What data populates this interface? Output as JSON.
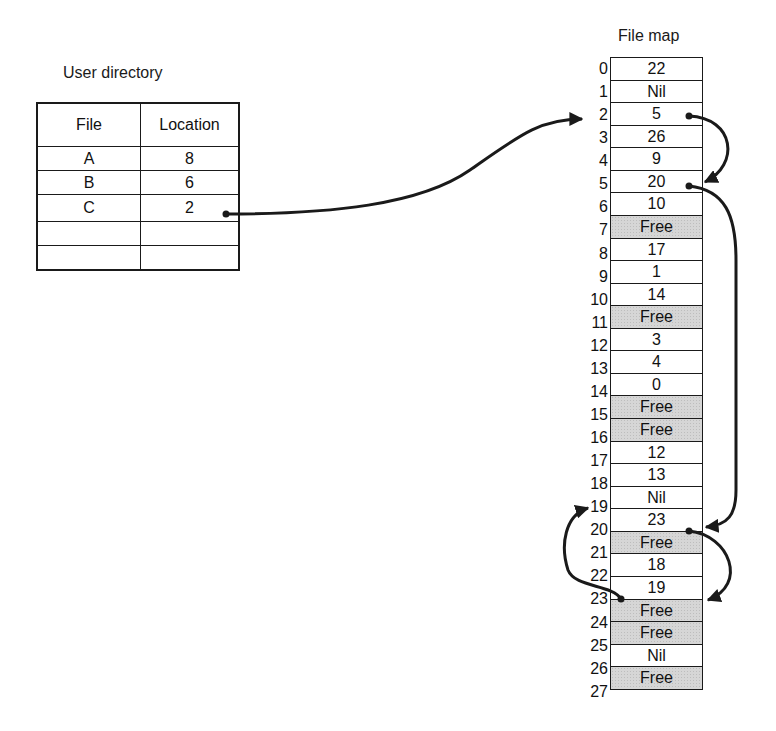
{
  "user_directory": {
    "title": "User directory",
    "columns": [
      "File",
      "Location"
    ],
    "rows": [
      {
        "file": "A",
        "location": "8"
      },
      {
        "file": "B",
        "location": "6"
      },
      {
        "file": "C",
        "location": "2"
      },
      {
        "file": "",
        "location": ""
      },
      {
        "file": "",
        "location": ""
      }
    ]
  },
  "file_map": {
    "title": "File map",
    "entries": [
      {
        "index": "0",
        "value": "22",
        "free": false
      },
      {
        "index": "1",
        "value": "Nil",
        "free": false
      },
      {
        "index": "2",
        "value": "5",
        "free": false
      },
      {
        "index": "3",
        "value": "26",
        "free": false
      },
      {
        "index": "4",
        "value": "9",
        "free": false
      },
      {
        "index": "5",
        "value": "20",
        "free": false
      },
      {
        "index": "6",
        "value": "10",
        "free": false
      },
      {
        "index": "7",
        "value": "Free",
        "free": true
      },
      {
        "index": "8",
        "value": "17",
        "free": false
      },
      {
        "index": "9",
        "value": "1",
        "free": false
      },
      {
        "index": "10",
        "value": "14",
        "free": false
      },
      {
        "index": "11",
        "value": "Free",
        "free": true
      },
      {
        "index": "12",
        "value": "3",
        "free": false
      },
      {
        "index": "13",
        "value": "4",
        "free": false
      },
      {
        "index": "14",
        "value": "0",
        "free": false
      },
      {
        "index": "15",
        "value": "Free",
        "free": true
      },
      {
        "index": "16",
        "value": "Free",
        "free": true
      },
      {
        "index": "17",
        "value": "12",
        "free": false
      },
      {
        "index": "18",
        "value": "13",
        "free": false
      },
      {
        "index": "19",
        "value": "Nil",
        "free": false
      },
      {
        "index": "20",
        "value": "23",
        "free": false
      },
      {
        "index": "21",
        "value": "Free",
        "free": true
      },
      {
        "index": "22",
        "value": "18",
        "free": false
      },
      {
        "index": "23",
        "value": "19",
        "free": false
      },
      {
        "index": "24",
        "value": "Free",
        "free": true
      },
      {
        "index": "25",
        "value": "Free",
        "free": true
      },
      {
        "index": "26",
        "value": "Nil",
        "free": false
      },
      {
        "index": "27",
        "value": "Free",
        "free": true
      }
    ]
  },
  "pointer_chain": {
    "file": "C",
    "links": [
      {
        "from": "directory.C",
        "to": "2"
      },
      {
        "from": "2",
        "to": "5"
      },
      {
        "from": "5",
        "to": "20"
      },
      {
        "from": "20",
        "to": "23"
      },
      {
        "from": "23",
        "to": "19"
      }
    ],
    "end_marker": "Nil"
  },
  "colors": {
    "line": "#1a1a1a",
    "free_fill": "#d6d6d6",
    "background": "#ffffff"
  }
}
